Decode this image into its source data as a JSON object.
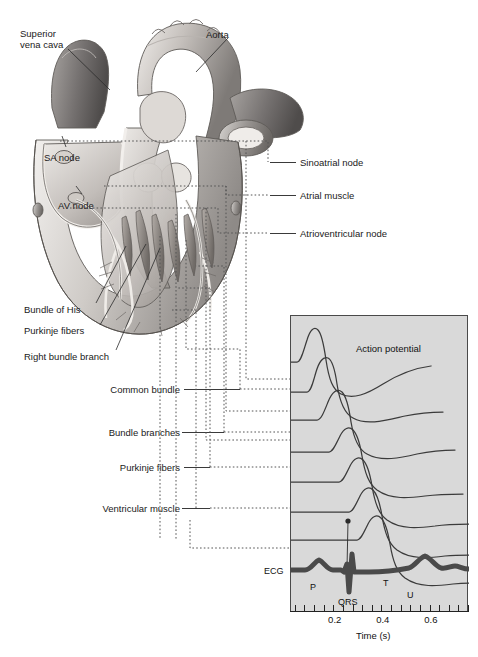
{
  "figure": {
    "background": "#ffffff",
    "panel_fill": "#d9d9d9",
    "ink": "#1a1a1a"
  },
  "heart_labels": [
    {
      "id": "superior-vena-cava",
      "text": "Superior\nvena cava",
      "x": 20,
      "y": 28,
      "align": "left"
    },
    {
      "id": "aorta",
      "text": "Aorta",
      "x": 206,
      "y": 29,
      "align": "left"
    },
    {
      "id": "sa-node",
      "text": "SA node",
      "x": 44,
      "y": 152,
      "align": "left"
    },
    {
      "id": "av-node",
      "text": "AV node",
      "x": 58,
      "y": 200,
      "align": "left"
    },
    {
      "id": "bundle-of-his",
      "text": "Bundle of His",
      "x": 24,
      "y": 304,
      "align": "left"
    },
    {
      "id": "purkinje-fibers-heart",
      "text": "Purkinje fibers",
      "x": 24,
      "y": 325,
      "align": "left"
    },
    {
      "id": "right-bundle-branch",
      "text": "Right bundle branch",
      "x": 24,
      "y": 351,
      "align": "left"
    }
  ],
  "right_labels": [
    {
      "id": "sinoatrial-node",
      "text": "Sinoatrial node",
      "x": 300,
      "y": 157
    },
    {
      "id": "atrial-muscle",
      "text": "Atrial muscle",
      "x": 300,
      "y": 190
    },
    {
      "id": "atrioventricular-node",
      "text": "Atrioventricular node",
      "x": 300,
      "y": 228
    }
  ],
  "left_labels": [
    {
      "id": "common-bundle",
      "text": "Common bundle",
      "x": 185,
      "y": 384
    },
    {
      "id": "bundle-branches",
      "text": "Bundle branches",
      "x": 185,
      "y": 427
    },
    {
      "id": "purkinje-fibers",
      "text": "Purkinje fibers",
      "x": 185,
      "y": 462
    },
    {
      "id": "ventricular-muscle",
      "text": "Ventricular muscle",
      "x": 185,
      "y": 503
    }
  ],
  "chart_data": {
    "type": "line",
    "title": "Action potential",
    "xlabel": "Time (s)",
    "ylabel": "",
    "xlim": [
      0.0,
      0.74
    ],
    "grid": false,
    "legend": "none",
    "tick_labels": [
      "0.2",
      "0.4",
      "0.6"
    ],
    "tick_values": [
      0.2,
      0.4,
      0.6
    ],
    "minor_tick_step": 0.04,
    "annotations": [
      {
        "id": "action-potential-label",
        "text": "Action potential",
        "x": 0.32,
        "y": 0.92
      },
      {
        "id": "ecg-label",
        "text": "ECG",
        "x": -0.045,
        "y": 0.105
      },
      {
        "id": "wave-p",
        "text": "P",
        "x": 0.105,
        "y": 0.055
      },
      {
        "id": "wave-qrs",
        "text": "QRS",
        "x": 0.255,
        "y": 0.01
      },
      {
        "id": "wave-t",
        "text": "T",
        "x": 0.525,
        "y": 0.055
      },
      {
        "id": "wave-u",
        "text": "U",
        "x": 0.625,
        "y": 0.02
      }
    ],
    "series": [
      {
        "name": "Sinoatrial node",
        "trace_index": 0,
        "baseline_y": 0.845,
        "upstroke_t": 0.035,
        "peak_t": 0.075,
        "repolarized_t": 0.52
      },
      {
        "name": "Atrial muscle",
        "trace_index": 1,
        "baseline_y": 0.735,
        "upstroke_t": 0.075,
        "peak_t": 0.105,
        "repolarized_t": 0.5
      },
      {
        "name": "Atrioventricular node",
        "trace_index": 2,
        "baseline_y": 0.655,
        "upstroke_t": 0.105,
        "peak_t": 0.15,
        "repolarized_t": 0.56
      },
      {
        "name": "Common bundle",
        "trace_index": 3,
        "baseline_y": 0.56,
        "upstroke_t": 0.175,
        "peak_t": 0.2,
        "repolarized_t": 0.6
      },
      {
        "name": "Bundle branches",
        "trace_index": 4,
        "baseline_y": 0.47,
        "upstroke_t": 0.205,
        "peak_t": 0.23,
        "repolarized_t": 0.64
      },
      {
        "name": "Purkinje fibers",
        "trace_index": 5,
        "baseline_y": 0.375,
        "upstroke_t": 0.235,
        "peak_t": 0.258,
        "repolarized_t": 0.67
      },
      {
        "name": "Ventricular muscle",
        "trace_index": 6,
        "baseline_y": 0.285,
        "upstroke_t": 0.262,
        "peak_t": 0.285,
        "repolarized_t": 0.7
      }
    ],
    "ecg": {
      "name": "ECG",
      "waves": [
        "P",
        "QRS",
        "T",
        "U"
      ],
      "p_center": 0.115,
      "qrs_center": 0.285,
      "t_center": 0.535,
      "u_center": 0.635
    }
  }
}
